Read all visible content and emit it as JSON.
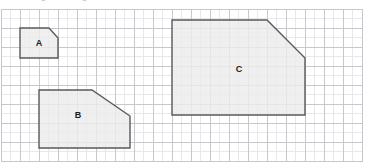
{
  "figure": {
    "title": "",
    "clipped_caption": "similar figures on grid",
    "width": 370,
    "height": 168,
    "background_color": "#ffffff"
  },
  "grid": {
    "origin_x": 1,
    "origin_y": 9,
    "cell_size": 19,
    "cols": 19,
    "rows": 8,
    "minor_divisions": 2,
    "major_line_color": "#c8c8cc",
    "minor_line_color": "#e8e8ec",
    "border_color": "#c8c8cc",
    "show_minor": true
  },
  "style": {
    "shape_fill": "#ebebeb",
    "shape_stroke": "#5a5a5a",
    "shape_stroke_width": 1.4,
    "label_color": "#1c1c1c"
  },
  "chart_data": {
    "type": "diagram",
    "xlabel": "",
    "ylabel": "",
    "grid": true,
    "units": "grid squares",
    "cell_size_px": 19,
    "shapes": [
      {
        "name": "A",
        "label": "A",
        "label_x": 39,
        "label_y": 43,
        "points_px": [
          [
            20,
            28
          ],
          [
            49,
            28
          ],
          [
            58,
            38
          ],
          [
            58,
            58
          ],
          [
            20,
            58
          ]
        ],
        "points_cells": [
          [
            1,
            1
          ],
          [
            2.5,
            1
          ],
          [
            3,
            1.5
          ],
          [
            3,
            2.5
          ],
          [
            1,
            2.5
          ]
        ],
        "width_cells": 2,
        "height_cells": 1.5,
        "scale_factor": 1
      },
      {
        "name": "B",
        "label": "B",
        "label_x": 78,
        "label_y": 115,
        "points_px": [
          [
            39,
            90
          ],
          [
            92,
            90
          ],
          [
            130,
            116
          ],
          [
            130,
            148
          ],
          [
            39,
            148
          ]
        ],
        "points_cells": [
          [
            2,
            4.263
          ],
          [
            4.789,
            4.263
          ],
          [
            6.789,
            5.632
          ],
          [
            6.789,
            7.316
          ],
          [
            2,
            7.316
          ]
        ],
        "width_cells": 4.8,
        "height_cells": 3.05,
        "scale_factor": 2
      },
      {
        "name": "C",
        "label": "C",
        "label_x": 239,
        "label_y": 69,
        "points_px": [
          [
            172,
            20
          ],
          [
            267,
            20
          ],
          [
            305,
            58
          ],
          [
            305,
            115
          ],
          [
            172,
            115
          ]
        ],
        "points_cells": [
          [
            9,
            0.579
          ],
          [
            14,
            0.579
          ],
          [
            16,
            2.579
          ],
          [
            16,
            5.579
          ],
          [
            9,
            5.579
          ]
        ],
        "width_cells": 7,
        "height_cells": 5,
        "scale_factor": 3.5
      }
    ]
  }
}
